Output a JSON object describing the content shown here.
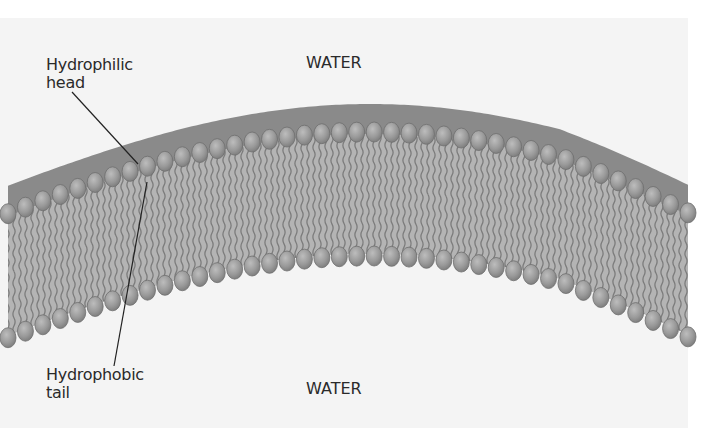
{
  "figure": {
    "labels": {
      "water_top": "WATER",
      "water_bottom": "WATER",
      "hydrophilic_line1": "Hydrophilic",
      "hydrophilic_line2": "head",
      "hydrophobic_line1": "Hydrophobic",
      "hydrophobic_line2": "tail"
    },
    "colors": {
      "background": "#ffffff",
      "panel": "#f4f4f4",
      "outer_layer": "#8a8a8a",
      "head_fill": "#9a9a9a",
      "head_highlight": "#b8b8b8",
      "head_outline": "#6e6e6e",
      "tail_fill": "#b4b4b4",
      "tail_line": "#7c7c7c",
      "text": "#2a2a2a",
      "leader_line": "#222222"
    },
    "membrane": {
      "head_count_top": 40,
      "head_count_bottom": 40,
      "x_start": 8,
      "x_end": 688
    }
  }
}
